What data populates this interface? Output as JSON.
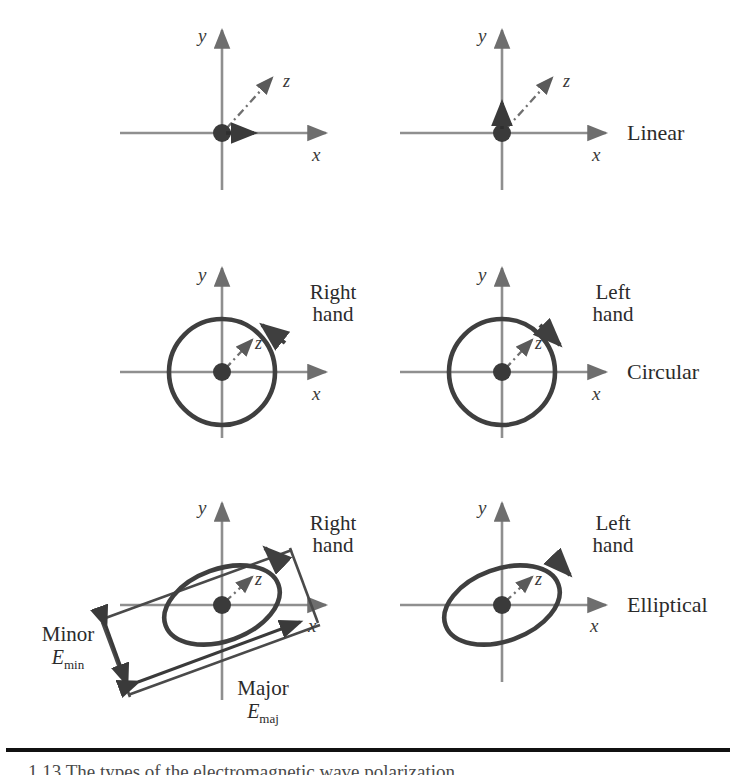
{
  "figure": {
    "axis_labels": {
      "x": "x",
      "y": "y",
      "z": "z"
    },
    "colors": {
      "axis": "#8a8a8a",
      "curve": "#4a4a4a",
      "origin": "#3a3a3a",
      "text": "#2b2b2b",
      "rule": "#111111"
    },
    "panels": [
      {
        "id": "linear-right",
        "row": 1,
        "column": 1,
        "x_label": "x",
        "y_label": "y",
        "z_label": "z",
        "hand_label": "",
        "type_label": "",
        "shape": "none",
        "field_arrow": "horizontal"
      },
      {
        "id": "linear-left",
        "row": 1,
        "column": 2,
        "x_label": "x",
        "y_label": "y",
        "z_label": "z",
        "hand_label": "",
        "type_label": "Linear",
        "shape": "none",
        "field_arrow": "vertical"
      },
      {
        "id": "circular-right",
        "row": 2,
        "column": 1,
        "x_label": "x",
        "y_label": "y",
        "z_label": "z",
        "hand_label_line1": "Right",
        "hand_label_line2": "hand",
        "type_label": "",
        "shape": "circle",
        "rotation_sense": "counterclockwise"
      },
      {
        "id": "circular-left",
        "row": 2,
        "column": 2,
        "x_label": "x",
        "y_label": "y",
        "z_label": "z",
        "hand_label_line1": "Left",
        "hand_label_line2": "hand",
        "type_label": "Circular",
        "shape": "circle",
        "rotation_sense": "clockwise"
      },
      {
        "id": "elliptical-right",
        "row": 3,
        "column": 1,
        "x_label": "x",
        "y_label": "y",
        "z_label": "z",
        "hand_label_line1": "Right",
        "hand_label_line2": "hand",
        "type_label": "",
        "shape": "ellipse",
        "rotation_sense": "counterclockwise",
        "minor_label": "Minor",
        "minor_symbol": "E",
        "minor_subscript": "min",
        "major_label": "Major",
        "major_symbol": "E",
        "major_subscript": "maj"
      },
      {
        "id": "elliptical-left",
        "row": 3,
        "column": 2,
        "x_label": "x",
        "y_label": "y",
        "z_label": "z",
        "hand_label_line1": "Left",
        "hand_label_line2": "hand",
        "type_label": "Elliptical",
        "shape": "ellipse",
        "rotation_sense": "clockwise"
      }
    ],
    "caption": "1.13  The types of the electromagnetic wave polarization."
  }
}
